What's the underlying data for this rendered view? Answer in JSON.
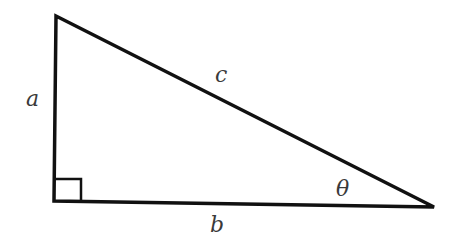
{
  "diagram": {
    "type": "right-triangle",
    "labels": {
      "vertical_leg": "a",
      "hypotenuse": "c",
      "horizontal_leg": "b",
      "angle": "θ"
    },
    "vertices": {
      "top": [
        56,
        16
      ],
      "right_angle": [
        54,
        201
      ],
      "right": [
        434,
        207
      ]
    },
    "stroke_color": "#111111",
    "label_color": "#3a3a3a"
  }
}
